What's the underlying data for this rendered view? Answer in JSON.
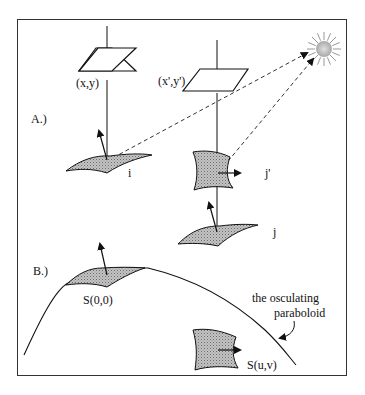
{
  "figure": {
    "panel_a_label": "A.)",
    "panel_b_label": "B.)",
    "labels": {
      "pixel_xy": "(x,y)",
      "pixel_xy_prime": "(x',y')",
      "patch_i": "i",
      "patch_j_prime": "j'",
      "patch_j": "j",
      "s00": "S(0,0)",
      "suv": "S(u,v)",
      "paraboloid_line1": "the osculating",
      "paraboloid_line2": "paraboloid"
    },
    "icons": [
      "light-source-sun-icon",
      "image-plane-pixel-icon",
      "surface-patch-icon",
      "normal-vector-arrow-icon"
    ],
    "colors": {
      "ink": "#111111",
      "patch_fill": "#b0b0b0",
      "background": "#ffffff"
    }
  }
}
